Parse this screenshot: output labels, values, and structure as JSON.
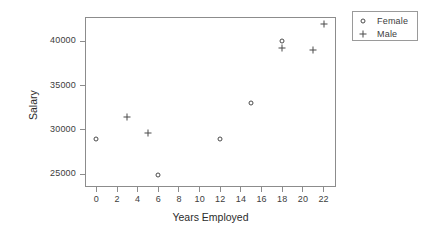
{
  "chart_data": {
    "type": "scatter",
    "title": "",
    "xlabel": "Years Employed",
    "ylabel": "Salary",
    "xlim": [
      -1.1,
      23.2
    ],
    "ylim": [
      23550,
      42750
    ],
    "xticks": [
      0,
      2,
      4,
      6,
      8,
      10,
      12,
      14,
      16,
      18,
      20,
      22
    ],
    "xtick_labels": [
      "0",
      "2",
      "4",
      "6",
      "8",
      "10",
      "12",
      "14",
      "16",
      "18",
      "20",
      "22"
    ],
    "yticks": [
      25000,
      30000,
      35000,
      40000
    ],
    "ytick_labels": [
      "25000",
      "30000",
      "35000",
      "40000"
    ],
    "grid": false,
    "legend_position": "right-top",
    "series": [
      {
        "name": "Female",
        "marker": "circle",
        "color": "#4a4a4a",
        "points": [
          {
            "x": 0,
            "y": 29000
          },
          {
            "x": 6,
            "y": 24900
          },
          {
            "x": 12,
            "y": 29000
          },
          {
            "x": 15,
            "y": 33000
          },
          {
            "x": 18,
            "y": 40000
          }
        ]
      },
      {
        "name": "Male",
        "marker": "plus",
        "color": "#4a4a4a",
        "points": [
          {
            "x": 3,
            "y": 31500
          },
          {
            "x": 5,
            "y": 29600
          },
          {
            "x": 18,
            "y": 39200
          },
          {
            "x": 21,
            "y": 39000
          },
          {
            "x": 22,
            "y": 42000
          }
        ]
      }
    ]
  },
  "legend": {
    "entries": [
      {
        "label": "Female",
        "marker": "circle"
      },
      {
        "label": "Male",
        "marker": "plus"
      }
    ]
  },
  "colors": {
    "axis": "#8c8c8c",
    "text": "#3d3d3d",
    "marker": "#4a4a4a",
    "background": "#ffffff"
  }
}
